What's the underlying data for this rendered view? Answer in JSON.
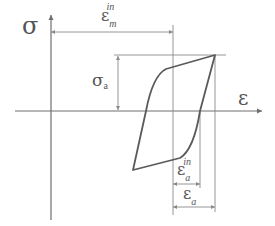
{
  "diagram": {
    "axes": {
      "y_label": "σ",
      "x_label": "ε"
    },
    "dimensions": {
      "eps_m_in": {
        "symbol": "ε",
        "sub": "m",
        "sup": "in"
      },
      "sigma_a": {
        "symbol": "σ",
        "sub": "a"
      },
      "eps_a_in": {
        "symbol": "ε",
        "sub": "a",
        "sup": "in"
      },
      "eps_a": {
        "symbol": "ε",
        "sub": "a"
      }
    },
    "colors": {
      "line": "#5a5a5a",
      "axis": "#6e6e6e",
      "text": "#555555"
    }
  }
}
